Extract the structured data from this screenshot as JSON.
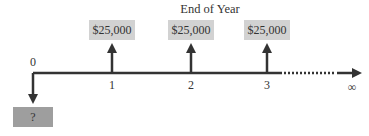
{
  "diagram": {
    "title": "End of Year",
    "timeline": {
      "start_label": "0",
      "end_label": "∞",
      "ticks": [
        {
          "label": "1",
          "cash_flow": "$25,000",
          "direction": "inflow"
        },
        {
          "label": "2",
          "cash_flow": "$25,000",
          "direction": "inflow"
        },
        {
          "label": "3",
          "cash_flow": "$25,000",
          "direction": "inflow"
        }
      ],
      "continuation": "dotted"
    },
    "present_value": {
      "period": "0",
      "label": "?",
      "direction": "outflow"
    },
    "colors": {
      "axis": "#333333",
      "cashflow_box": "#d2d2d2",
      "unknown_box": "#9e9e9e"
    }
  }
}
